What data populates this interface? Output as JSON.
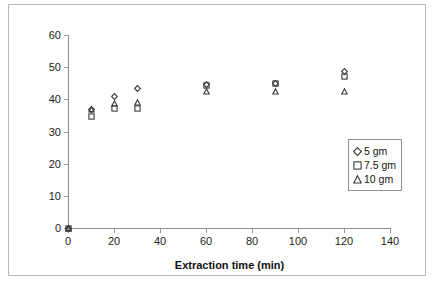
{
  "chart_data": {
    "type": "scatter",
    "title": "",
    "xlabel": "Extraction time (min)",
    "ylabel": "% Extraction of ursolic acid",
    "xlim": [
      0,
      140
    ],
    "ylim": [
      0,
      60
    ],
    "xticks": [
      0,
      20,
      40,
      60,
      80,
      100,
      120,
      140
    ],
    "yticks": [
      0,
      10,
      20,
      30,
      40,
      50,
      60
    ],
    "grid": false,
    "legend_position": "right-inside",
    "x": [
      0,
      10,
      20,
      30,
      60,
      90,
      120
    ],
    "series": [
      {
        "name": "5 gm",
        "marker": "diamond",
        "values": [
          0,
          36.8,
          40.8,
          43.5,
          44.6,
          45.0,
          48.7
        ]
      },
      {
        "name": "7.5 gm",
        "marker": "square",
        "values": [
          0,
          34.6,
          37.2,
          37.3,
          44.4,
          44.8,
          47.0
        ]
      },
      {
        "name": "10 gm",
        "marker": "triangle",
        "values": [
          0,
          36.8,
          38.7,
          39.0,
          42.3,
          42.3,
          42.3
        ]
      }
    ]
  },
  "axes": {
    "x_title": "Extraction time (min)",
    "y_title": "% Extraction of ursolic acid",
    "x_tick_labels": [
      "0",
      "20",
      "40",
      "60",
      "80",
      "100",
      "120",
      "140"
    ],
    "y_tick_labels": [
      "0",
      "10",
      "20",
      "30",
      "40",
      "50",
      "60"
    ]
  },
  "legend": {
    "items": [
      {
        "label": "5 gm",
        "marker": "diamond-icon"
      },
      {
        "label": "7.5 gm",
        "marker": "square-icon"
      },
      {
        "label": "10 gm",
        "marker": "triangle-icon"
      }
    ]
  },
  "colors": {
    "marker_stroke": "#3a3a3a",
    "axis": "#8d8d8d",
    "frame": "#b9b9b9",
    "background": "#ffffff"
  }
}
